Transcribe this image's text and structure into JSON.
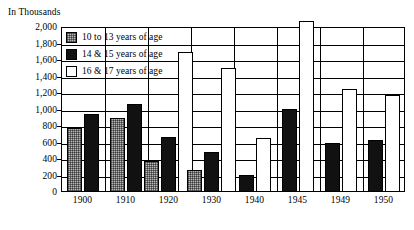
{
  "chart_data": {
    "type": "bar",
    "title": "",
    "subtitle": "",
    "unit_caption": "In Thousands",
    "xlabel": "",
    "ylabel": "",
    "ylim": [
      0,
      2000
    ],
    "ytick_step": 200,
    "ytick_labels": [
      "2,000",
      "1,800",
      "1,600",
      "1,400",
      "1,200",
      "1,000",
      "800",
      "600",
      "400",
      "200",
      "0"
    ],
    "ytick_values": [
      2000,
      1800,
      1600,
      1400,
      1200,
      1000,
      800,
      600,
      400,
      200,
      0
    ],
    "grid": true,
    "legend_position": "top-left-inside",
    "categories": [
      "1900",
      "1910",
      "1920",
      "1930",
      "1940",
      "1945",
      "1949",
      "1950"
    ],
    "series": [
      {
        "name": "10 to 13 years of age",
        "swatch": "s0",
        "color": "#b8b8b8",
        "values": [
          780,
          900,
          380,
          270,
          null,
          null,
          null,
          null
        ]
      },
      {
        "name": "14 & 15 years of age",
        "swatch": "s1",
        "color": "#111111",
        "values": [
          950,
          1070,
          670,
          480,
          210,
          1010,
          590,
          630
        ]
      },
      {
        "name": "16 & 17 years of age",
        "swatch": "s2",
        "color": "#ffffff",
        "values": [
          null,
          null,
          1700,
          1500,
          650,
          2070,
          1250,
          1180
        ]
      }
    ]
  }
}
